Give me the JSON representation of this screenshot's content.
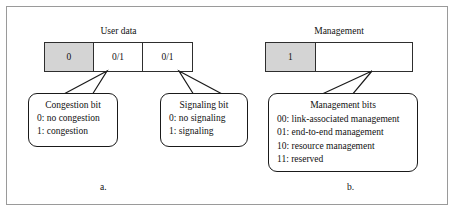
{
  "figure": {
    "sections": [
      {
        "caption": "User data",
        "sublabel": "a.",
        "cells": [
          {
            "value": "0",
            "shaded": true
          },
          {
            "value": "0/1",
            "shaded": false
          },
          {
            "value": "0/1",
            "shaded": false
          }
        ],
        "callouts": [
          {
            "title": "Congestion bit",
            "lines": [
              "0: no congestion",
              "1: congestion"
            ]
          },
          {
            "title": "Signaling bit",
            "lines": [
              "0: no signaling",
              "1: signaling"
            ]
          }
        ]
      },
      {
        "caption": "Management",
        "sublabel": "b.",
        "cells": [
          {
            "value": "1",
            "shaded": true
          },
          {
            "value": "",
            "shaded": false
          }
        ],
        "callouts": [
          {
            "title": "Management bits",
            "lines": [
              "00: link-associated management",
              "01: end-to-end management",
              "10: resource management",
              "11: reserved"
            ]
          }
        ]
      }
    ],
    "colors": {
      "shaded_cell": "#d4d4d4",
      "bar_border": "#2e2e2e",
      "callout_border": "#1a1a1a",
      "frame_border": "#9a9a9a",
      "text": "#111111",
      "background": "#ffffff"
    }
  }
}
